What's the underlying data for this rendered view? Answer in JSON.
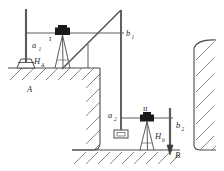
{
  "figure": {
    "type": "surveying-levelling-diagram",
    "stroke_color": "#4a4a4a",
    "instrument_color": "#1a1a1a",
    "background": "#ffffff"
  },
  "labels": {
    "a1": {
      "base": "a",
      "sub": "1"
    },
    "b1": {
      "base": "b",
      "sub": "1"
    },
    "a2": {
      "base": "a",
      "sub": "2"
    },
    "b2": {
      "base": "b",
      "sub": "2"
    },
    "HA": {
      "base": "H",
      "sub": "A"
    },
    "Hb": {
      "base": "H",
      "sub": "b"
    },
    "point_A": "A",
    "point_B": "B",
    "instrument_1": "I",
    "instrument_2": "II"
  },
  "elements": {
    "benchmark_monument": "benchmark-monument-A",
    "level_instrument_1": "level-instrument-I",
    "level_instrument_2": "level-instrument-II",
    "tripod_1": "tripod-one",
    "tripod_2": "tripod-two",
    "staff_a1": "backsight-staff-a1",
    "staff_b1": "foresight-staff-b1",
    "staff_a2": "backsight-staff-a2",
    "staff_b2": "foresight-staff-b2",
    "suspended_tape": "suspended-inclined-tape",
    "staff_plate": "staff-foot-plate",
    "ground_upper": "upper-ground-surface",
    "pit_floor": "excavation-pit-floor",
    "pit_wall_left": "excavation-left-wall",
    "cliff_right": "right-cliff-wall",
    "hatching": "ground-hatching"
  }
}
